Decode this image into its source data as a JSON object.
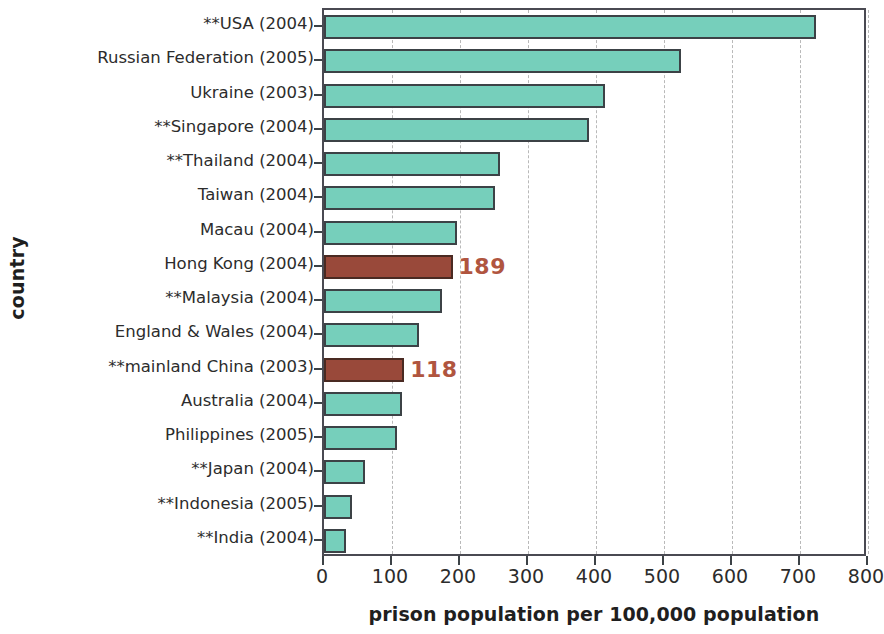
{
  "chart_data": {
    "type": "bar",
    "orientation": "horizontal",
    "title": "",
    "xlabel": "prison population per 100,000 population",
    "ylabel": "country",
    "xlim": [
      0,
      800
    ],
    "xticks": [
      0,
      100,
      200,
      300,
      400,
      500,
      600,
      700,
      800
    ],
    "xtick_labels": [
      "0",
      "100",
      "200",
      "300",
      "400",
      "500",
      "600",
      "700",
      "800"
    ],
    "grid": "vertical-dashed",
    "legend": null,
    "categories": [
      "**USA (2004)",
      "Russian Federation (2005)",
      "Ukraine (2003)",
      "**Singapore (2004)",
      "**Thailand (2004)",
      "Taiwan (2004)",
      "Macau (2004)",
      "Hong Kong (2004)",
      "**Malaysia (2004)",
      "England & Wales (2004)",
      "**mainland China (2003)",
      "Australia (2004)",
      "Philippines (2005)",
      "**Japan (2004)",
      "**Indonesia (2005)",
      "**India (2004)"
    ],
    "values": [
      724,
      525,
      413,
      390,
      259,
      251,
      196,
      189,
      174,
      140,
      118,
      115,
      107,
      60,
      41,
      32
    ],
    "highlighted": [
      "Hong Kong (2004)",
      "**mainland China (2003)"
    ],
    "data_labels": [
      {
        "category": "Hong Kong (2004)",
        "text": "189"
      },
      {
        "category": "**mainland China (2003)",
        "text": "118"
      }
    ],
    "colors": {
      "bar": "#76cfbb",
      "bar_edge": "#3c4246",
      "highlight_bar": "#99493a",
      "highlight_edge": "#4a2a22",
      "data_label": "#b0553f",
      "axis": "#3c4246",
      "grid": "#b9b9b9",
      "text": "#2c2c2c"
    }
  }
}
